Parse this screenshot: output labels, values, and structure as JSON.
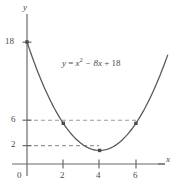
{
  "chart_data": {
    "type": "line",
    "title": "",
    "subtitle": "",
    "xlabel": "x",
    "ylabel": "y",
    "equation": "y = x² − 8x + 18",
    "equation_parts": {
      "lhs": "y",
      "equals": "=",
      "term1_base": "x",
      "term1_exp": "2",
      "term2": "− 8x",
      "term3": "+ 18"
    },
    "grid": false,
    "legend": null,
    "xlim": [
      0,
      7.8
    ],
    "ylim": [
      0,
      21
    ],
    "x_ticks": [
      2,
      4,
      6
    ],
    "x_tick_labels": [
      "2",
      "4",
      "6"
    ],
    "y_ticks": [
      2,
      6,
      18
    ],
    "y_tick_labels": [
      "2",
      "6",
      "18"
    ],
    "origin_label": "0",
    "dashed_guides": [
      {
        "y": 6,
        "from_x": 0,
        "to_x": 6
      },
      {
        "y": 2,
        "from_x": 0,
        "to_x": 4
      }
    ],
    "marked_points": [
      {
        "x": 0,
        "y": 18
      },
      {
        "x": 2,
        "y": 6
      },
      {
        "x": 4,
        "y": 2
      },
      {
        "x": 6,
        "y": 6
      }
    ],
    "vertex": {
      "x": 4,
      "y": 2
    },
    "curve_domain": [
      0,
      7.75
    ],
    "series": [
      {
        "name": "y = x^2 - 8x + 18",
        "x": [
          0,
          0.5,
          1,
          1.5,
          2,
          2.5,
          3,
          3.5,
          4,
          4.5,
          5,
          5.5,
          6,
          6.5,
          7,
          7.5,
          7.75
        ],
        "values": [
          18,
          14.25,
          11,
          8.25,
          6,
          4.25,
          3,
          2.25,
          2,
          2.25,
          3,
          4.25,
          6,
          8.25,
          11,
          14.25,
          15.81
        ]
      }
    ],
    "colors": {
      "curve": "#5a5a5a",
      "axis": "#6a6a6a",
      "dashed": "#9a9a9a",
      "text": "#4a4a4a",
      "point": "#4a4a4a",
      "background": "#ffffff"
    }
  }
}
